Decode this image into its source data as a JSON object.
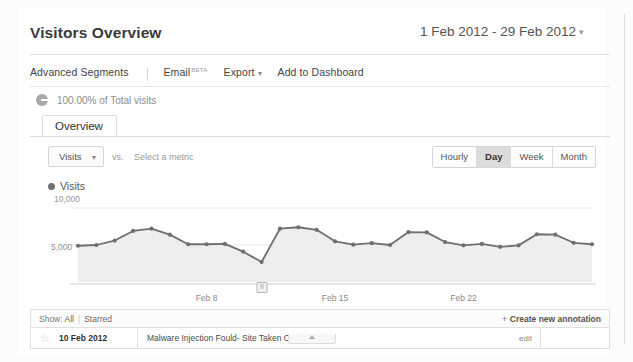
{
  "header": {
    "title": "Visitors Overview",
    "date_range": "1 Feb 2012 - 29 Feb 2012",
    "date_caret": "▾"
  },
  "toolbar": {
    "advanced_segments": "Advanced Segments",
    "email": "Email",
    "email_badge": "BETA",
    "export": "Export",
    "export_caret": "▾",
    "add_to_dashboard": "Add to Dashboard"
  },
  "scope": {
    "icon": "pie-chart-icon",
    "text": "100.00% of Total visits"
  },
  "tabs": [
    {
      "label": "Overview",
      "active": true
    }
  ],
  "metric_row": {
    "primary_metric": "Visits",
    "primary_caret": "▾",
    "vs_label": "vs.",
    "secondary_metric_placeholder": "Select a metric",
    "granularity": [
      {
        "label": "Hourly",
        "active": false
      },
      {
        "label": "Day",
        "active": true
      },
      {
        "label": "Week",
        "active": false
      },
      {
        "label": "Month",
        "active": false
      }
    ]
  },
  "legend": {
    "series_label": "Visits",
    "series_color": "#6f6f6f"
  },
  "chart_data": {
    "type": "line",
    "title": "Visits",
    "xlabel": "",
    "ylabel": "Visits",
    "ylim": [
      0,
      10000
    ],
    "ytick_labels": [
      "10,000",
      "5,000"
    ],
    "ytick_values": [
      10000,
      5000
    ],
    "grid": true,
    "legend_position": "top-left",
    "area_fill": true,
    "x": [
      "1 Feb 2012",
      "2 Feb 2012",
      "3 Feb 2012",
      "4 Feb 2012",
      "5 Feb 2012",
      "6 Feb 2012",
      "7 Feb 2012",
      "8 Feb 2012",
      "9 Feb 2012",
      "10 Feb 2012",
      "11 Feb 2012",
      "12 Feb 2012",
      "13 Feb 2012",
      "14 Feb 2012",
      "15 Feb 2012",
      "16 Feb 2012",
      "17 Feb 2012",
      "18 Feb 2012",
      "19 Feb 2012",
      "20 Feb 2012",
      "21 Feb 2012",
      "22 Feb 2012",
      "23 Feb 2012",
      "24 Feb 2012",
      "25 Feb 2012",
      "26 Feb 2012",
      "27 Feb 2012",
      "28 Feb 2012",
      "29 Feb 2012"
    ],
    "xtick_labels": [
      "Feb 8",
      "Feb 15",
      "Feb 22"
    ],
    "xtick_indices": [
      7,
      14,
      21
    ],
    "values": [
      4900,
      5000,
      5600,
      6900,
      7200,
      6400,
      5100,
      5100,
      5150,
      4100,
      2700,
      7200,
      7400,
      7050,
      5500,
      5050,
      5250,
      5000,
      6750,
      6700,
      5400,
      4950,
      5150,
      4750,
      4950,
      6450,
      6400,
      5300,
      5100
    ],
    "series": [
      {
        "name": "Visits",
        "color": "#6f6f6f",
        "values": [
          4900,
          5000,
          5600,
          6900,
          7200,
          6400,
          5100,
          5100,
          5150,
          4100,
          2700,
          7200,
          7400,
          7050,
          5500,
          5050,
          5250,
          5000,
          6750,
          6700,
          5400,
          4950,
          5150,
          4750,
          4950,
          6450,
          6400,
          5300,
          5100
        ]
      }
    ]
  },
  "annotations": {
    "show_label": "Show:",
    "filter_all": "All",
    "filter_separator": "|",
    "filter_starred": "Starred",
    "create_new": "Create new annotation",
    "create_plus": "+",
    "columns": [
      "star",
      "date",
      "text",
      "edit"
    ],
    "rows": [
      {
        "star": "☆",
        "date": "10 Feb 2012",
        "text": "Malware Injection Fould- Site Taken Offline",
        "edit": "edit"
      }
    ]
  }
}
